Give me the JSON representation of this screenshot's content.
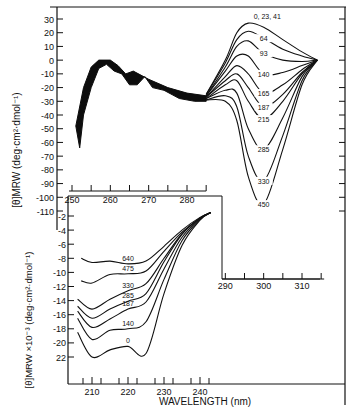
{
  "chart_data": [
    {
      "type": "line",
      "panel": "main",
      "title": "",
      "xlabel": "",
      "ylabel": "[θ]MRW (deg·cm²·dmol⁻¹)",
      "xlim": [
        248,
        318
      ],
      "ylim": [
        -110,
        35
      ],
      "x_ticks": [
        "250",
        "260",
        "270",
        "280",
        "290",
        "300",
        "310"
      ],
      "y_ticks": [
        "30",
        "20",
        "10",
        "0",
        "-10",
        "-20",
        "-30",
        "-40",
        "-50",
        "-60",
        "-70",
        "-80",
        "-90",
        "-100",
        "-110"
      ],
      "grid": false,
      "series_labels": [
        "0, 23, 41",
        "64",
        "93",
        "140",
        "165",
        "187",
        "215",
        "285",
        "330",
        "450"
      ],
      "series": [
        {
          "name": "0, 23, 41",
          "x": [
            285,
            290,
            293,
            296,
            300,
            305,
            310,
            314
          ],
          "y": [
            -25,
            0,
            20,
            27,
            24,
            15,
            6,
            0
          ]
        },
        {
          "name": "64",
          "x": [
            285,
            290,
            293,
            296,
            300,
            305,
            310,
            314
          ],
          "y": [
            -25,
            -2,
            15,
            21,
            16,
            8,
            3,
            0
          ]
        },
        {
          "name": "93",
          "x": [
            285,
            290,
            293,
            296,
            300,
            305,
            310,
            314
          ],
          "y": [
            -26,
            -5,
            10,
            14,
            5,
            0,
            -1,
            0
          ]
        },
        {
          "name": "140",
          "x": [
            285,
            290,
            293,
            296,
            300,
            305,
            310,
            314
          ],
          "y": [
            -26,
            -8,
            3,
            3,
            -10,
            -9,
            -4,
            0
          ]
        },
        {
          "name": "165",
          "x": [
            285,
            290,
            293,
            296,
            300,
            305,
            310,
            314
          ],
          "y": [
            -27,
            -12,
            -4,
            -10,
            -24,
            -18,
            -7,
            0
          ]
        },
        {
          "name": "187",
          "x": [
            285,
            290,
            293,
            296,
            300,
            305,
            310,
            314
          ],
          "y": [
            -27,
            -15,
            -10,
            -20,
            -34,
            -25,
            -9,
            0
          ]
        },
        {
          "name": "215",
          "x": [
            285,
            290,
            293,
            296,
            300,
            305,
            310,
            314
          ],
          "y": [
            -28,
            -18,
            -15,
            -30,
            -43,
            -30,
            -10,
            0
          ]
        },
        {
          "name": "285",
          "x": [
            285,
            290,
            293,
            296,
            300,
            305,
            310,
            314
          ],
          "y": [
            -28,
            -22,
            -24,
            -50,
            -65,
            -42,
            -12,
            0
          ]
        },
        {
          "name": "330",
          "x": [
            285,
            290,
            293,
            296,
            300,
            305,
            310,
            314
          ],
          "y": [
            -29,
            -26,
            -34,
            -70,
            -88,
            -55,
            -15,
            0
          ]
        },
        {
          "name": "450",
          "x": [
            285,
            290,
            293,
            296,
            300,
            305,
            310,
            314
          ],
          "y": [
            -29,
            -30,
            -44,
            -85,
            -105,
            -65,
            -18,
            0
          ]
        }
      ],
      "shared_band_region": {
        "x_range": [
          251,
          285
        ],
        "description": "overlapping curves forming dark band: rises from ~-50..-65 at 251 nm to ~0 at 258 nm, shoulders near 262 and 268 nm, descending to ~-28 at 285 nm"
      }
    },
    {
      "type": "line",
      "panel": "inset",
      "title": "",
      "xlabel": "WAVELENGTH (nm)",
      "ylabel": "[θ]MRW ×10⁻³ (deg·cm²·dmol⁻¹)",
      "xlim": [
        205,
        245
      ],
      "ylim": [
        -23,
        0
      ],
      "x_ticks": [
        "210",
        "220",
        "230",
        "240"
      ],
      "y_ticks": [
        "-2",
        "-4",
        "-6",
        "-8",
        "-10",
        "-12",
        "-14",
        "-16",
        "-18",
        "-20",
        "22"
      ],
      "grid": false,
      "series": [
        {
          "name": "640",
          "x": [
            207,
            210,
            215,
            220,
            225,
            230,
            235,
            240,
            243
          ],
          "y": [
            -8,
            -8.6,
            -8.4,
            -8.8,
            -8.4,
            -6.3,
            -4,
            -2.2,
            -1.5
          ]
        },
        {
          "name": "475",
          "x": [
            207,
            210,
            215,
            220,
            225,
            230,
            235,
            240,
            243
          ],
          "y": [
            -11.2,
            -11.5,
            -10.3,
            -10.2,
            -9.8,
            -7,
            -4.3,
            -2.3,
            -1.5
          ]
        },
        {
          "name": "330",
          "x": [
            206,
            210,
            215,
            220,
            225,
            230,
            235,
            240,
            243
          ],
          "y": [
            -13.8,
            -15.2,
            -13.8,
            -12.6,
            -11.6,
            -8,
            -4.5,
            -2.3,
            -1.5
          ]
        },
        {
          "name": "285",
          "x": [
            206,
            210,
            215,
            220,
            225,
            230,
            235,
            240,
            243
          ],
          "y": [
            -14.8,
            -16.5,
            -15.2,
            -14.1,
            -13,
            -8.5,
            -4.6,
            -2.3,
            -1.5
          ]
        },
        {
          "name": "187",
          "x": [
            206,
            210,
            215,
            220,
            225,
            230,
            235,
            240,
            243
          ],
          "y": [
            -15.5,
            -17.8,
            -16.6,
            -15.2,
            -14.2,
            -9.5,
            -5,
            -2.4,
            -1.5
          ]
        },
        {
          "name": "140",
          "x": [
            206,
            210,
            215,
            220,
            225,
            230,
            235,
            240,
            243
          ],
          "y": [
            -16.5,
            -19.5,
            -18.2,
            -18,
            -17,
            -11,
            -5.5,
            -2.5,
            -1.5
          ]
        },
        {
          "name": "0",
          "x": [
            206,
            210,
            215,
            220,
            225,
            230,
            235,
            240,
            243
          ],
          "y": [
            -18.5,
            -22,
            -21,
            -20.5,
            -21.5,
            -13,
            -6.2,
            -2.6,
            -1.5
          ]
        }
      ]
    }
  ]
}
